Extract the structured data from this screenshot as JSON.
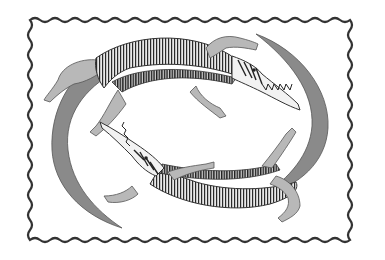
{
  "image": {
    "description": "Grayscale illustration of two crocodiles circling each other head-to-tail inside a wavy-edged frame",
    "alt": "Two crocodiles forming a circle",
    "colors": {
      "background": "#ffffff",
      "frame": "#333333",
      "body_light": "#b8b8b8",
      "tail_mid": "#8a8a8a",
      "stripe_dark": "#2a2a2a"
    },
    "subjects": [
      {
        "name": "upper-crocodile",
        "facing": "right",
        "position": "top"
      },
      {
        "name": "lower-crocodile",
        "facing": "left",
        "position": "bottom"
      }
    ]
  }
}
